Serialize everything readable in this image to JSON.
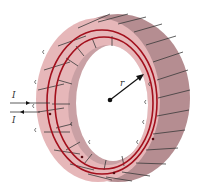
{
  "figure": {
    "labels": {
      "current_in": "I",
      "current_out": "I",
      "radius": "r"
    },
    "colors": {
      "background": "#ffffff",
      "torus_front": "#e6b7b9",
      "torus_side": "#b58d91",
      "torus_inner_wall": "#c9a0a4",
      "field_line": "#a3101d",
      "winding_wire": "#3a3a3a",
      "arrow": "#111111"
    },
    "field_lines_count": 2,
    "winding_turns_visible": 22
  }
}
